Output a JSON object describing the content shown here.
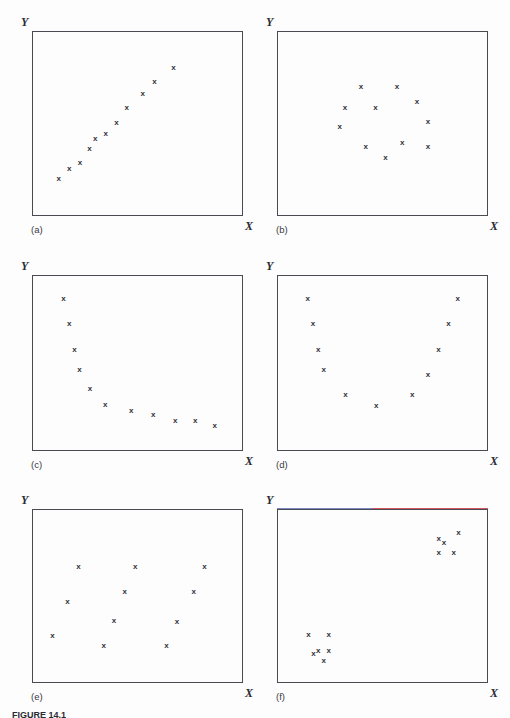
{
  "figure": {
    "caption": "FIGURE 14.1",
    "axis_labels": {
      "x": "X",
      "y": "Y"
    }
  },
  "chart_data": [
    {
      "type": "scatter",
      "panel": "(a)",
      "title": "",
      "xlabel": "X",
      "ylabel": "Y",
      "xlim": [
        0,
        1
      ],
      "ylim": [
        0,
        1
      ],
      "grid": false,
      "legend": "none",
      "marker": "x",
      "pattern": "strong positive linear relationship",
      "x": [
        0.127,
        0.176,
        0.228,
        0.272,
        0.3,
        0.35,
        0.4,
        0.449,
        0.525,
        0.58,
        0.671
      ],
      "y": [
        0.202,
        0.256,
        0.288,
        0.363,
        0.421,
        0.444,
        0.504,
        0.584,
        0.663,
        0.725,
        0.804
      ]
    },
    {
      "type": "scatter",
      "panel": "(b)",
      "title": "",
      "xlabel": "X",
      "ylabel": "Y",
      "xlim": [
        0,
        1
      ],
      "ylim": [
        0,
        1
      ],
      "grid": false,
      "legend": "none",
      "marker": "x",
      "pattern": "no relationship, random cluster",
      "x": [
        0.398,
        0.569,
        0.663,
        0.322,
        0.467,
        0.715,
        0.297,
        0.42,
        0.593,
        0.715,
        0.514
      ],
      "y": [
        0.702,
        0.702,
        0.619,
        0.588,
        0.588,
        0.509,
        0.482,
        0.374,
        0.396,
        0.374,
        0.316
      ]
    },
    {
      "type": "scatter",
      "panel": "(c)",
      "title": "",
      "xlabel": "X",
      "ylabel": "Y",
      "xlim": [
        0,
        1
      ],
      "ylim": [
        0,
        1
      ],
      "grid": false,
      "legend": "none",
      "marker": "x",
      "pattern": "decreasing curvilinear (inverse) relationship",
      "x": [
        0.149,
        0.176,
        0.201,
        0.225,
        0.275,
        0.347,
        0.47,
        0.575,
        0.679,
        0.774,
        0.866
      ],
      "y": [
        0.868,
        0.722,
        0.574,
        0.464,
        0.356,
        0.264,
        0.229,
        0.205,
        0.176,
        0.176,
        0.147
      ]
    },
    {
      "type": "scatter",
      "panel": "(d)",
      "title": "",
      "xlabel": "X",
      "ylabel": "Y",
      "xlim": [
        0,
        1
      ],
      "ylim": [
        0,
        1
      ],
      "grid": false,
      "legend": "none",
      "marker": "x",
      "pattern": "U-shaped curvilinear (parabolic) relationship",
      "x": [
        0.146,
        0.171,
        0.196,
        0.222,
        0.324,
        0.47,
        0.641,
        0.715,
        0.765,
        0.813,
        0.857
      ],
      "y": [
        0.868,
        0.722,
        0.574,
        0.464,
        0.319,
        0.261,
        0.319,
        0.433,
        0.574,
        0.722,
        0.868
      ]
    },
    {
      "type": "scatter",
      "panel": "(e)",
      "title": "",
      "xlabel": "X",
      "ylabel": "Y",
      "xlim": [
        0,
        1
      ],
      "ylim": [
        0,
        1
      ],
      "grid": false,
      "legend": "none",
      "marker": "x",
      "pattern": "no relationship, dispersed scatter",
      "x": [
        0.22,
        0.489,
        0.818,
        0.44,
        0.766,
        0.168,
        0.389,
        0.687,
        0.097,
        0.34,
        0.637
      ],
      "y": [
        0.67,
        0.67,
        0.67,
        0.526,
        0.526,
        0.47,
        0.357,
        0.351,
        0.272,
        0.214,
        0.218
      ]
    },
    {
      "type": "scatter",
      "panel": "(f)",
      "title": "",
      "xlabel": "X",
      "ylabel": "Y",
      "xlim": [
        0,
        1
      ],
      "ylim": [
        0,
        1
      ],
      "grid": false,
      "legend": "none",
      "marker": "x",
      "pattern": "two distinct clusters",
      "x": [
        0.766,
        0.791,
        0.86,
        0.766,
        0.838,
        0.149,
        0.245,
        0.195,
        0.245,
        0.173,
        0.222
      ],
      "y": [
        0.829,
        0.805,
        0.866,
        0.751,
        0.751,
        0.276,
        0.276,
        0.189,
        0.189,
        0.168,
        0.13
      ]
    }
  ],
  "panels": [
    {
      "id": "a",
      "label": "(a)"
    },
    {
      "id": "b",
      "label": "(b)"
    },
    {
      "id": "c",
      "label": "(c)"
    },
    {
      "id": "d",
      "label": "(d)"
    },
    {
      "id": "e",
      "label": "(e)"
    },
    {
      "id": "f",
      "label": "(f)"
    }
  ],
  "colors": {
    "frame": "#4a4a52",
    "marker": "#33333b",
    "label": "#2b2b33",
    "background": "#fdfdfd"
  }
}
